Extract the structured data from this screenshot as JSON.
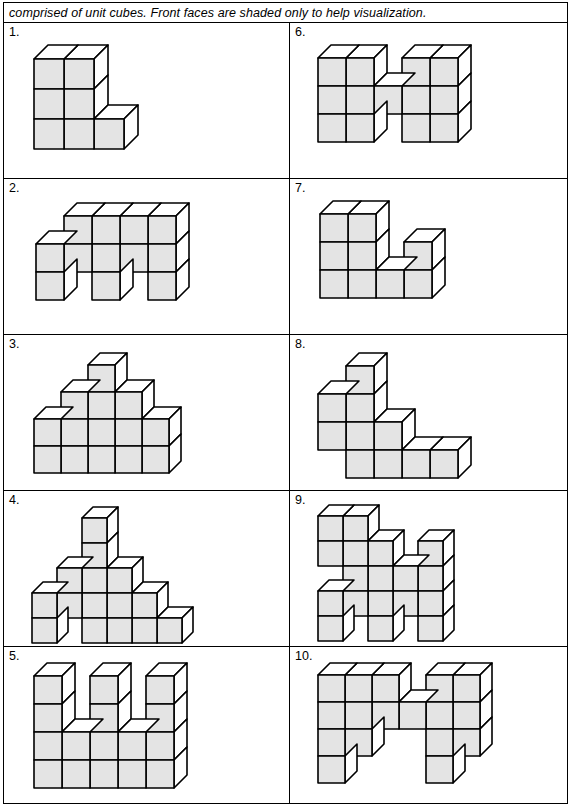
{
  "header": {
    "instruction": "comprised of unit cubes. Front faces are shaded only to help visualization."
  },
  "style": {
    "front_face_color": "#e4e4e4",
    "top_face_color": "#ffffff",
    "side_face_color": "#ffffff",
    "outline_color": "#000000",
    "page_background": "#ffffff"
  },
  "problems": [
    {
      "number": "1.",
      "position": "left-row-1",
      "cube_size": 30,
      "depth": 14,
      "origin_x": 30,
      "origin_y": 22,
      "cube_count": 7,
      "cells": [
        [
          0,
          0
        ],
        [
          1,
          0
        ],
        [
          0,
          1
        ],
        [
          1,
          1
        ],
        [
          0,
          2
        ],
        [
          1,
          2
        ],
        [
          2,
          2
        ]
      ]
    },
    {
      "number": "6.",
      "position": "right-row-1",
      "cube_size": 28,
      "depth": 13,
      "origin_x": 28,
      "origin_y": 22,
      "cube_count": 13,
      "cells": [
        [
          0,
          0
        ],
        [
          1,
          0
        ],
        [
          3,
          0
        ],
        [
          4,
          0
        ],
        [
          0,
          1
        ],
        [
          1,
          1
        ],
        [
          2,
          1
        ],
        [
          3,
          1
        ],
        [
          4,
          1
        ],
        [
          0,
          2
        ],
        [
          1,
          2
        ],
        [
          3,
          2
        ],
        [
          4,
          2
        ]
      ]
    },
    {
      "number": "2.",
      "position": "left-row-2",
      "cube_size": 28,
      "depth": 13,
      "origin_x": 32,
      "origin_y": 24,
      "cube_count": 12,
      "cells": [
        [
          1,
          0
        ],
        [
          2,
          0
        ],
        [
          3,
          0
        ],
        [
          4,
          0
        ],
        [
          0,
          1
        ],
        [
          1,
          1
        ],
        [
          2,
          1
        ],
        [
          3,
          1
        ],
        [
          4,
          1
        ],
        [
          0,
          2
        ],
        [
          2,
          2
        ],
        [
          4,
          2
        ]
      ]
    },
    {
      "number": "7.",
      "position": "right-row-2",
      "cube_size": 28,
      "depth": 13,
      "origin_x": 30,
      "origin_y": 22,
      "cube_count": 9,
      "cells": [
        [
          0,
          0
        ],
        [
          1,
          0
        ],
        [
          0,
          1
        ],
        [
          1,
          1
        ],
        [
          3,
          1
        ],
        [
          0,
          2
        ],
        [
          1,
          2
        ],
        [
          2,
          2
        ],
        [
          3,
          2
        ]
      ]
    },
    {
      "number": "3.",
      "position": "left-row-3",
      "cube_size": 27,
      "depth": 12,
      "origin_x": 30,
      "origin_y": 18,
      "cube_count": 14,
      "cells": [
        [
          2,
          0
        ],
        [
          1,
          1
        ],
        [
          2,
          1
        ],
        [
          3,
          1
        ],
        [
          0,
          2
        ],
        [
          1,
          2
        ],
        [
          2,
          2
        ],
        [
          3,
          2
        ],
        [
          4,
          2
        ],
        [
          0,
          3
        ],
        [
          1,
          3
        ],
        [
          2,
          3
        ],
        [
          3,
          3
        ],
        [
          4,
          3
        ]
      ]
    },
    {
      "number": "8.",
      "position": "right-row-3",
      "cube_size": 28,
      "depth": 13,
      "origin_x": 28,
      "origin_y": 18,
      "cube_count": 10,
      "cells": [
        [
          1,
          0
        ],
        [
          0,
          1
        ],
        [
          1,
          1
        ],
        [
          0,
          2
        ],
        [
          1,
          2
        ],
        [
          2,
          2
        ],
        [
          1,
          3
        ],
        [
          2,
          3
        ],
        [
          3,
          3
        ],
        [
          4,
          3
        ]
      ]
    },
    {
      "number": "4.",
      "position": "left-row-4",
      "cube_size": 25,
      "depth": 11,
      "origin_x": 28,
      "origin_y": 16,
      "cube_count": 17,
      "cells": [
        [
          2,
          0
        ],
        [
          2,
          1
        ],
        [
          1,
          2
        ],
        [
          2,
          2
        ],
        [
          3,
          2
        ],
        [
          0,
          3
        ],
        [
          1,
          3
        ],
        [
          2,
          3
        ],
        [
          3,
          3
        ],
        [
          4,
          3
        ],
        [
          0,
          4
        ],
        [
          2,
          4
        ],
        [
          3,
          4
        ],
        [
          4,
          4
        ],
        [
          5,
          4
        ],
        [
          4,
          3
        ],
        [
          5,
          4
        ]
      ]
    },
    {
      "number": "9.",
      "position": "right-row-4",
      "cube_size": 25,
      "depth": 11,
      "origin_x": 28,
      "origin_y": 14,
      "cube_count": 18,
      "cells": [
        [
          0,
          0
        ],
        [
          1,
          0
        ],
        [
          0,
          1
        ],
        [
          1,
          1
        ],
        [
          2,
          1
        ],
        [
          4,
          1
        ],
        [
          1,
          2
        ],
        [
          2,
          2
        ],
        [
          3,
          2
        ],
        [
          4,
          2
        ],
        [
          0,
          3
        ],
        [
          1,
          3
        ],
        [
          2,
          3
        ],
        [
          3,
          3
        ],
        [
          4,
          3
        ],
        [
          0,
          4
        ],
        [
          2,
          4
        ],
        [
          4,
          4
        ]
      ]
    },
    {
      "number": "5.",
      "position": "left-row-5",
      "cube_size": 28,
      "depth": 13,
      "origin_x": 30,
      "origin_y": 16,
      "cube_count": 16,
      "cells": [
        [
          0,
          0
        ],
        [
          2,
          0
        ],
        [
          4,
          0
        ],
        [
          0,
          1
        ],
        [
          2,
          1
        ],
        [
          4,
          1
        ],
        [
          0,
          2
        ],
        [
          1,
          2
        ],
        [
          2,
          2
        ],
        [
          3,
          2
        ],
        [
          4,
          2
        ],
        [
          0,
          3
        ],
        [
          1,
          3
        ],
        [
          2,
          3
        ],
        [
          3,
          3
        ],
        [
          4,
          3
        ]
      ]
    },
    {
      "number": "10.",
      "position": "right-row-5",
      "cube_size": 27,
      "depth": 12,
      "origin_x": 28,
      "origin_y": 16,
      "cube_count": 16,
      "cells": [
        [
          0,
          0
        ],
        [
          1,
          0
        ],
        [
          2,
          0
        ],
        [
          4,
          0
        ],
        [
          5,
          0
        ],
        [
          0,
          1
        ],
        [
          1,
          1
        ],
        [
          2,
          1
        ],
        [
          3,
          1
        ],
        [
          4,
          1
        ],
        [
          5,
          1
        ],
        [
          0,
          2
        ],
        [
          1,
          2
        ],
        [
          4,
          2
        ],
        [
          5,
          2
        ],
        [
          0,
          3
        ],
        [
          4,
          3
        ]
      ]
    }
  ]
}
